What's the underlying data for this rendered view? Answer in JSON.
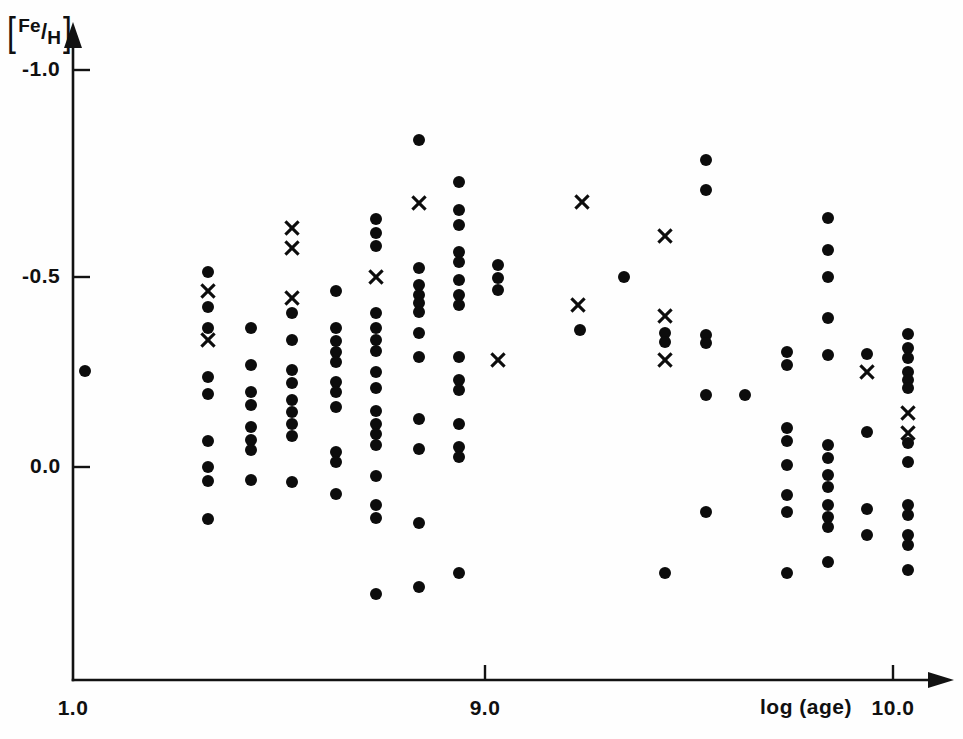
{
  "figure": {
    "width": 963,
    "height": 739,
    "background": "#ffffff",
    "ink_color": "#0c0c0c"
  },
  "axes": {
    "y_label_bracket_open": "[",
    "y_label_numerator": "Fe",
    "y_label_slash": "/",
    "y_label_denominator": "H",
    "y_label_bracket_close": "]",
    "x_label": "log (age)",
    "y_ticks": [
      {
        "value": -1.0,
        "label": "-1.0",
        "px": 70
      },
      {
        "value": -0.5,
        "label": "-0.5",
        "px": 277
      },
      {
        "value": 0.0,
        "label": "0.0",
        "px": 467
      }
    ],
    "x_ticks": [
      {
        "value": 1.0,
        "label": "1.0",
        "px": 73
      },
      {
        "value": 9.0,
        "label": "9.0",
        "px": 485
      },
      {
        "value": 10.0,
        "label": "10.0",
        "px": 893
      }
    ]
  },
  "chart_data": {
    "type": "scatter",
    "title": "",
    "xlabel": "log (age)",
    "ylabel": "[Fe/H]",
    "xlim": [
      1.0,
      10.15
    ],
    "ylim": [
      -1.12,
      0.62
    ],
    "grid": false,
    "legend": "none",
    "axis_style": "arrow-tipped open axes, ticks outward",
    "series": [
      {
        "name": "dot",
        "marker": "filled-circle",
        "color": "#0c0c0c",
        "count": 142,
        "points_px": [
          [
            85,
            371
          ],
          [
            208,
            272
          ],
          [
            208,
            307
          ],
          [
            208,
            328
          ],
          [
            208,
            377
          ],
          [
            208,
            394
          ],
          [
            208,
            441
          ],
          [
            208,
            467
          ],
          [
            208,
            481
          ],
          [
            208,
            519
          ],
          [
            251,
            328
          ],
          [
            251,
            365
          ],
          [
            251,
            392
          ],
          [
            251,
            405
          ],
          [
            251,
            427
          ],
          [
            251,
            440
          ],
          [
            251,
            450
          ],
          [
            251,
            480
          ],
          [
            292,
            313
          ],
          [
            292,
            340
          ],
          [
            292,
            370
          ],
          [
            292,
            383
          ],
          [
            292,
            400
          ],
          [
            292,
            412
          ],
          [
            292,
            424
          ],
          [
            292,
            436
          ],
          [
            292,
            482
          ],
          [
            336,
            291
          ],
          [
            336,
            328
          ],
          [
            336,
            341
          ],
          [
            336,
            352
          ],
          [
            336,
            362
          ],
          [
            336,
            382
          ],
          [
            336,
            392
          ],
          [
            336,
            407
          ],
          [
            336,
            452
          ],
          [
            336,
            462
          ],
          [
            336,
            494
          ],
          [
            376,
            219
          ],
          [
            376,
            233
          ],
          [
            376,
            246
          ],
          [
            376,
            313
          ],
          [
            376,
            328
          ],
          [
            376,
            340
          ],
          [
            376,
            351
          ],
          [
            376,
            372
          ],
          [
            376,
            388
          ],
          [
            376,
            411
          ],
          [
            376,
            424
          ],
          [
            376,
            434
          ],
          [
            376,
            445
          ],
          [
            376,
            476
          ],
          [
            376,
            505
          ],
          [
            376,
            518
          ],
          [
            376,
            594
          ],
          [
            419,
            140
          ],
          [
            419,
            268
          ],
          [
            419,
            285
          ],
          [
            419,
            295
          ],
          [
            419,
            303
          ],
          [
            419,
            312
          ],
          [
            419,
            333
          ],
          [
            419,
            357
          ],
          [
            419,
            419
          ],
          [
            419,
            449
          ],
          [
            419,
            523
          ],
          [
            419,
            587
          ],
          [
            459,
            182
          ],
          [
            459,
            210
          ],
          [
            459,
            225
          ],
          [
            459,
            252
          ],
          [
            459,
            262
          ],
          [
            459,
            280
          ],
          [
            459,
            295
          ],
          [
            459,
            305
          ],
          [
            459,
            357
          ],
          [
            459,
            380
          ],
          [
            459,
            390
          ],
          [
            459,
            424
          ],
          [
            459,
            447
          ],
          [
            459,
            457
          ],
          [
            459,
            573
          ],
          [
            498,
            265
          ],
          [
            498,
            278
          ],
          [
            498,
            290
          ],
          [
            580,
            330
          ],
          [
            624,
            277
          ],
          [
            665,
            333
          ],
          [
            665,
            342
          ],
          [
            665,
            573
          ],
          [
            706,
            160
          ],
          [
            706,
            190
          ],
          [
            706,
            335
          ],
          [
            706,
            343
          ],
          [
            706,
            395
          ],
          [
            706,
            512
          ],
          [
            745,
            395
          ],
          [
            787,
            352
          ],
          [
            787,
            365
          ],
          [
            787,
            428
          ],
          [
            787,
            441
          ],
          [
            787,
            465
          ],
          [
            787,
            495
          ],
          [
            787,
            512
          ],
          [
            787,
            573
          ],
          [
            828,
            218
          ],
          [
            828,
            250
          ],
          [
            828,
            277
          ],
          [
            828,
            318
          ],
          [
            828,
            355
          ],
          [
            828,
            445
          ],
          [
            828,
            458
          ],
          [
            828,
            475
          ],
          [
            828,
            487
          ],
          [
            828,
            505
          ],
          [
            828,
            517
          ],
          [
            828,
            527
          ],
          [
            828,
            562
          ],
          [
            867,
            354
          ],
          [
            867,
            432
          ],
          [
            867,
            509
          ],
          [
            867,
            535
          ],
          [
            908,
            334
          ],
          [
            908,
            348
          ],
          [
            908,
            358
          ],
          [
            908,
            372
          ],
          [
            908,
            380
          ],
          [
            908,
            388
          ],
          [
            908,
            443
          ],
          [
            908,
            462
          ],
          [
            908,
            505
          ],
          [
            908,
            515
          ],
          [
            908,
            535
          ],
          [
            908,
            545
          ],
          [
            908,
            570
          ]
        ]
      },
      {
        "name": "cross",
        "marker": "x",
        "color": "#0c0c0c",
        "count": 17,
        "points_px": [
          [
            208,
            291
          ],
          [
            208,
            340
          ],
          [
            292,
            228
          ],
          [
            292,
            248
          ],
          [
            292,
            298
          ],
          [
            376,
            277
          ],
          [
            419,
            203
          ],
          [
            498,
            360
          ],
          [
            582,
            202
          ],
          [
            578,
            305
          ],
          [
            665,
            236
          ],
          [
            665,
            316
          ],
          [
            665,
            360
          ],
          [
            867,
            372
          ],
          [
            908,
            413
          ],
          [
            908,
            433
          ]
        ]
      }
    ]
  }
}
